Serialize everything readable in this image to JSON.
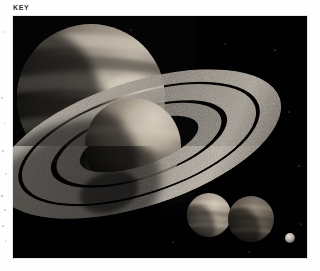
{
  "figure": {
    "key_label": "KEY",
    "caption_color": "#2e2e2e",
    "plate": {
      "background_color": "#010101",
      "width_px": 294,
      "height_px": 242,
      "left_px": 13,
      "top_px": 16
    },
    "scene": {
      "description": "Dark space illustration of a ringed gas giant system",
      "objects": [
        {
          "name": "banded-gas-giant",
          "role": "large background banded planet, upper left",
          "center": [
            78,
            82
          ],
          "radius": 74,
          "body_color": "#8e867c",
          "shadow_color": "#0b0a09",
          "band_count": 9,
          "lit_from": "upper-right"
        },
        {
          "name": "ringed-planet",
          "role": "main foreground ringed planet, center",
          "center": [
            120,
            130
          ],
          "radius": 48,
          "body_color": "#9b9084",
          "shadow_color": "#0a0908",
          "lit_from": "upper-right"
        },
        {
          "name": "planetary-ring-system",
          "role": "tilted speckled rings encircling the main planet",
          "outer_radius_x": 148,
          "outer_radius_y": 62,
          "tilt_deg": -18,
          "ring_color": "#a39a8e",
          "gap_color": "#050505",
          "band_count": 3,
          "texture": "speckled rocky"
        },
        {
          "name": "moon-light",
          "role": "smaller banded moon, lower right, brighter",
          "center": [
            196,
            199
          ],
          "radius": 22,
          "body_color": "#a79c8e",
          "band_count": 6
        },
        {
          "name": "moon-dark",
          "role": "smaller banded moon, lower right, darker",
          "center": [
            238,
            203
          ],
          "radius": 23,
          "body_color": "#6d6459",
          "band_count": 6
        },
        {
          "name": "distant-moonlet",
          "role": "tiny bright moonlet, far bottom right",
          "center": [
            277,
            222
          ],
          "radius": 5,
          "body_color": "#cfc7bb"
        }
      ],
      "starfield": {
        "visible": true,
        "density": "sparse",
        "star_color": "#cfcfcf"
      }
    }
  }
}
